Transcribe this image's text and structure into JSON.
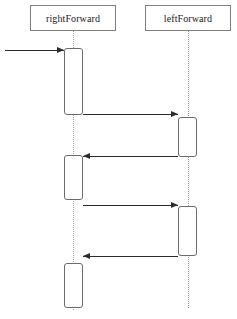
{
  "diagram": {
    "type": "uml-sequence-diagram",
    "width": 237,
    "height": 319,
    "background_color": "#ffffff",
    "line_color": "#2b2b2b",
    "box_border_color": "#6b6b6b",
    "header_border_color": "#808080",
    "lifeline_color": "#9a9a9a"
  },
  "participants": [
    {
      "id": "rightForward",
      "label": "rightForward",
      "box": {
        "x": 30,
        "y": 5,
        "w": 86,
        "h": 26
      },
      "lifeline_x": 73,
      "lifeline_top": 31,
      "lifeline_bottom": 310
    },
    {
      "id": "leftForward",
      "label": "leftForward",
      "box": {
        "x": 145,
        "y": 5,
        "w": 86,
        "h": 26
      },
      "lifeline_x": 188,
      "lifeline_top": 31,
      "lifeline_bottom": 308
    }
  ],
  "activations": [
    {
      "participant": "rightForward",
      "x": 64,
      "y": 48,
      "w": 19,
      "h": 67
    },
    {
      "participant": "leftForward",
      "x": 178,
      "y": 117,
      "w": 19,
      "h": 40
    },
    {
      "participant": "rightForward",
      "x": 64,
      "y": 155,
      "w": 19,
      "h": 45
    },
    {
      "participant": "leftForward",
      "x": 178,
      "y": 206,
      "w": 19,
      "h": 50
    },
    {
      "participant": "rightForward",
      "x": 64,
      "y": 263,
      "w": 19,
      "h": 45
    }
  ],
  "messages": [
    {
      "label": "",
      "direction": "right",
      "x1": 5,
      "x2": 64,
      "y": 50,
      "from": "external",
      "to": "rightForward"
    },
    {
      "label": "",
      "direction": "right",
      "x1": 83,
      "x2": 178,
      "y": 114,
      "from": "rightForward",
      "to": "leftForward"
    },
    {
      "label": "",
      "direction": "left",
      "x1": 178,
      "x2": 83,
      "y": 156,
      "from": "leftForward",
      "to": "rightForward"
    },
    {
      "label": "",
      "direction": "right",
      "x1": 83,
      "x2": 178,
      "y": 205,
      "from": "rightForward",
      "to": "leftForward"
    },
    {
      "label": "",
      "direction": "left",
      "x1": 178,
      "x2": 83,
      "y": 256,
      "from": "leftForward",
      "to": "rightForward"
    }
  ]
}
